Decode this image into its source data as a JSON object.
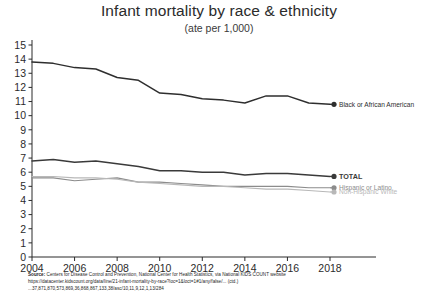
{
  "chart_data": {
    "type": "line",
    "title": "Infant mortality by race & ethnicity",
    "subtitle": "(ate per 1,000)",
    "xlabel": "",
    "ylabel": "",
    "xlim": [
      2004,
      2018
    ],
    "ylim": [
      0,
      15
    ],
    "grid": false,
    "legend_position": "right-inline-endpoint-labels",
    "x": [
      2004,
      2005,
      2006,
      2007,
      2008,
      2009,
      2010,
      2011,
      2012,
      2013,
      2014,
      2015,
      2016,
      2017,
      2018
    ],
    "xticks": [
      "2004",
      "2006",
      "2008",
      "2010",
      "2012",
      "2014",
      "2016",
      "2018"
    ],
    "yticks": [
      "0",
      "1",
      "2",
      "3",
      "4",
      "5",
      "6",
      "7",
      "8",
      "9",
      "10",
      "11",
      "12",
      "13",
      "14",
      "15"
    ],
    "series": [
      {
        "name": "Black or African American",
        "color": "#2e2e2e",
        "endpoint_value": 10.8,
        "values": [
          13.8,
          13.7,
          13.4,
          13.3,
          12.7,
          12.5,
          11.6,
          11.5,
          11.2,
          11.1,
          10.9,
          11.4,
          11.4,
          10.9,
          10.8
        ]
      },
      {
        "name": "TOTAL",
        "color": "#3a3a3a",
        "endpoint_value": 5.7,
        "values": [
          6.8,
          6.9,
          6.7,
          6.8,
          6.6,
          6.4,
          6.1,
          6.1,
          6.0,
          6.0,
          5.8,
          5.9,
          5.9,
          5.8,
          5.7
        ]
      },
      {
        "name": "Hispanic or Latino",
        "color": "#8c8c8c",
        "endpoint_value": 4.9,
        "values": [
          5.6,
          5.6,
          5.4,
          5.5,
          5.6,
          5.3,
          5.3,
          5.2,
          5.1,
          5.0,
          5.0,
          5.0,
          5.0,
          4.9,
          4.9
        ]
      },
      {
        "name": "Non-Hispanic White",
        "color": "#b8b8b8",
        "endpoint_value": 4.6,
        "values": [
          5.7,
          5.7,
          5.6,
          5.6,
          5.5,
          5.3,
          5.2,
          5.1,
          5.0,
          5.0,
          4.9,
          4.8,
          4.8,
          4.7,
          4.6
        ]
      }
    ]
  },
  "footnote": {
    "source_label": "Source:",
    "line1": " Centers for Disease Control and Prevention, National Center for Health Statistics, via National KIDS COUNT website",
    "line2": "https://datacenter.kidscount.org/data/line/21-infant-mortality-by-race?loc=1&loct=1#1/any/false/... (ctd.)",
    "line3": "...37,871,870,573,869,36,868,867,133,38/asc/10,11,9,12,1,13/284"
  }
}
